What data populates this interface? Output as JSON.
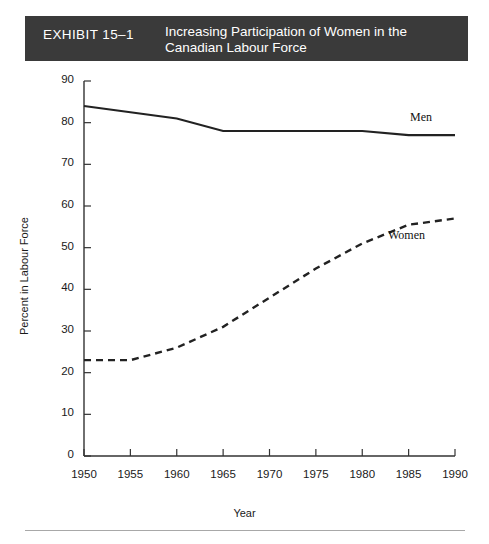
{
  "header": {
    "exhibit_label": "EXHIBIT 15–1",
    "title_line_1": "Increasing Participation of Women in the",
    "title_line_2": "Canadian Labour Force",
    "background_color": "#3a3a3a",
    "text_color": "#ffffff"
  },
  "chart_data": {
    "type": "line",
    "title": "Increasing Participation of Women in the Canadian Labour Force",
    "xlabel": "Year",
    "ylabel": "Percent in Labour Force",
    "x": [
      1950,
      1955,
      1960,
      1965,
      1970,
      1975,
      1980,
      1985,
      1990
    ],
    "xlim": [
      1950,
      1990
    ],
    "ylim": [
      0,
      90
    ],
    "xticks": [
      "1950",
      "1955",
      "1960",
      "1965",
      "1970",
      "1975",
      "1980",
      "1985",
      "1990"
    ],
    "yticks": [
      "0",
      "10",
      "20",
      "30",
      "40",
      "50",
      "60",
      "70",
      "80",
      "90"
    ],
    "grid": false,
    "legend_position": "inline-annotations",
    "series": [
      {
        "name": "Men",
        "values": [
          84,
          82.5,
          81,
          78,
          78,
          78,
          78,
          77,
          77
        ],
        "style": "solid",
        "color": "#222222",
        "annotation": "Men"
      },
      {
        "name": "Women",
        "values": [
          23,
          23,
          26,
          31,
          38,
          45,
          51,
          55.5,
          57
        ],
        "style": "dashed",
        "color": "#222222",
        "annotation": "Women"
      }
    ]
  },
  "footer": {
    "rule_color": "#a8a8a8"
  }
}
